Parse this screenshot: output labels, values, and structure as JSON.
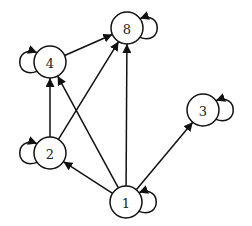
{
  "graph": {
    "type": "directed",
    "colors": {
      "stroke": "#111111",
      "fill": "#ffffff",
      "label": "#222222"
    },
    "nodes": [
      {
        "id": "1",
        "label": "1",
        "x": 126,
        "y": 202
      },
      {
        "id": "2",
        "label": "2",
        "x": 50,
        "y": 153
      },
      {
        "id": "3",
        "label": "3",
        "x": 203,
        "y": 110
      },
      {
        "id": "4",
        "label": "4",
        "x": 50,
        "y": 62
      },
      {
        "id": "8",
        "label": "8",
        "x": 127,
        "y": 28
      }
    ],
    "edges": [
      {
        "from": "1",
        "to": "2"
      },
      {
        "from": "1",
        "to": "4"
      },
      {
        "from": "1",
        "to": "8"
      },
      {
        "from": "1",
        "to": "3"
      },
      {
        "from": "1",
        "to": "1"
      },
      {
        "from": "2",
        "to": "4"
      },
      {
        "from": "2",
        "to": "8"
      },
      {
        "from": "2",
        "to": "2"
      },
      {
        "from": "4",
        "to": "8"
      },
      {
        "from": "4",
        "to": "4"
      },
      {
        "from": "8",
        "to": "8"
      },
      {
        "from": "3",
        "to": "3"
      }
    ]
  }
}
